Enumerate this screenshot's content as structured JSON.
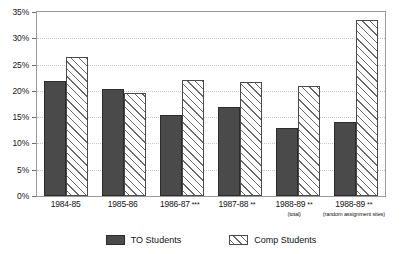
{
  "chart_data": {
    "type": "bar",
    "title": "",
    "subtitle": "",
    "xlabel": "",
    "ylabel": "",
    "ylim": [
      0,
      35
    ],
    "ytick_labels": [
      "0%",
      "5%",
      "10%",
      "15%",
      "20%",
      "25%",
      "30%",
      "35%"
    ],
    "ytick_values": [
      0,
      5,
      10,
      15,
      20,
      25,
      30,
      35
    ],
    "grid": true,
    "legend_position": "bottom",
    "categories": [
      "1984-85",
      "1985-86",
      "1986-87",
      "1987-88",
      "1988-89",
      "1988-89"
    ],
    "category_markers": [
      "",
      "",
      "***",
      "**",
      "**",
      "**"
    ],
    "category_sublabels": [
      "",
      "",
      "",
      "",
      "(total)",
      "(random assignment sites)"
    ],
    "series": [
      {
        "name": "TO Students",
        "color": "#4a4a4a",
        "fill": "solid",
        "values": [
          21.8,
          20.3,
          15.5,
          17.0,
          13.0,
          14.0
        ]
      },
      {
        "name": "Comp Students",
        "color": "#ffffff",
        "fill": "diagonal-hatch",
        "values": [
          26.5,
          19.6,
          22.0,
          21.7,
          21.0,
          33.5
        ]
      }
    ]
  },
  "legend": {
    "items": [
      {
        "label": "TO Students",
        "swatch": "solid-dark-swatch"
      },
      {
        "label": "Comp Students",
        "swatch": "hatched-swatch"
      }
    ]
  },
  "colors": {
    "series_to": "#4a4a4a",
    "series_comp": "#ffffff",
    "hatch": "#6b6b6b",
    "frame": "#9a9a9a",
    "gridline": "#c9c9c9",
    "text": "#131313",
    "background": "#ffffff"
  }
}
